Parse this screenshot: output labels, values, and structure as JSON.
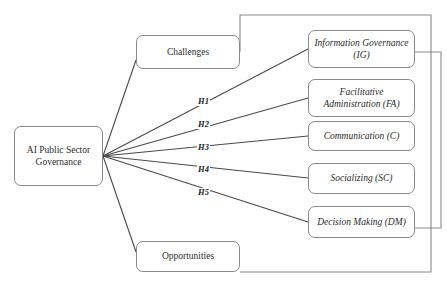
{
  "diagram": {
    "type": "conceptual-framework",
    "stroke_color": "#8a8a8a",
    "line_color": "#4a4a4a",
    "text_color": "#2b2b2b",
    "background": "#ffffff"
  },
  "nodes": {
    "central": {
      "label": "AI Public Sector Governance",
      "x": 14,
      "y": 126,
      "w": 89,
      "h": 60
    },
    "challenges": {
      "label": "Challenges",
      "x": 136,
      "y": 35,
      "w": 104,
      "h": 34
    },
    "opportunities": {
      "label": "Opportunities",
      "x": 136,
      "y": 241,
      "w": 104,
      "h": 31
    },
    "outcomes": [
      {
        "label": "Information Governance (IG)",
        "x": 308,
        "y": 30,
        "w": 107,
        "h": 38
      },
      {
        "label": "Facilitative Administration (FA)",
        "x": 308,
        "y": 79,
        "w": 107,
        "h": 38
      },
      {
        "label": "Communication (C)",
        "x": 308,
        "y": 121,
        "w": 107,
        "h": 30
      },
      {
        "label": "Socializing (SC)",
        "x": 308,
        "y": 163,
        "w": 107,
        "h": 31
      },
      {
        "label": "Decision Making (DM)",
        "x": 308,
        "y": 206,
        "w": 107,
        "h": 32
      }
    ]
  },
  "hypotheses": [
    {
      "label": "H1",
      "x": 197,
      "y": 97
    },
    {
      "label": "H2",
      "x": 197,
      "y": 120
    },
    {
      "label": "H3",
      "x": 197,
      "y": 143
    },
    {
      "label": "H4",
      "x": 197,
      "y": 165
    },
    {
      "label": "H5",
      "x": 197,
      "y": 188
    }
  ]
}
